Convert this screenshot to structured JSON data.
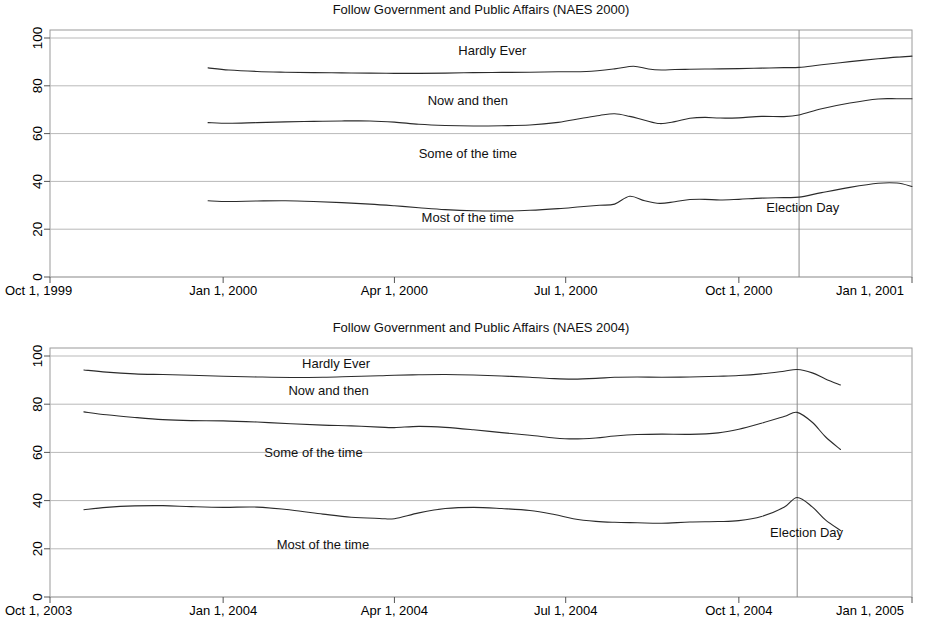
{
  "chart_data": [
    {
      "id": "naes2000",
      "type": "line",
      "title": "Follow Government and Public Affairs (NAES 2000)",
      "xlabel": "",
      "ylabel": "",
      "ylim": [
        0,
        100
      ],
      "yticks": [
        0,
        20,
        40,
        60,
        80,
        100
      ],
      "ytick_labels": [
        "0",
        "20",
        "40",
        "60",
        "80",
        "100"
      ],
      "xtick_labels": [
        "Oct 1, 1999",
        "Jan 1, 2000",
        "Apr 1, 2000",
        "Jul 1, 2000",
        "Oct 1, 2000",
        "Jan 1, 2001"
      ],
      "xlim_days": [
        0,
        458
      ],
      "xticks_days": [
        0,
        92,
        183,
        274,
        366,
        458
      ],
      "grid": true,
      "legend_position": "inline-annotations",
      "annotations": [
        {
          "name": "hardly-ever",
          "text": "Hardly Ever",
          "x_days": 235,
          "y": 93
        },
        {
          "name": "now-and-then",
          "text": "Now and then",
          "x_days": 222,
          "y": 72
        },
        {
          "name": "some-of-the-time",
          "text": "Some of the time",
          "x_days": 222,
          "y": 50
        },
        {
          "name": "most-of-the-time",
          "text": "Most of the time",
          "x_days": 222,
          "y": 23
        },
        {
          "name": "election-day",
          "text": "Election Day",
          "x_days": 400,
          "y": 27
        }
      ],
      "vlines": [
        {
          "name": "election-day-line",
          "x_days": 398,
          "label": "Election Day"
        }
      ],
      "series": [
        {
          "name": "Hardly Ever (cumulative)",
          "x_days": [
            84,
            95,
            110,
            125,
            140,
            155,
            170,
            183,
            196,
            210,
            225,
            240,
            255,
            270,
            285,
            300,
            310,
            318,
            325,
            332,
            340,
            348,
            356,
            366,
            378,
            390,
            398,
            410,
            425,
            440,
            450,
            458
          ],
          "values": [
            87.5,
            86.6,
            86.0,
            85.7,
            85.5,
            85.4,
            85.3,
            85.2,
            85.2,
            85.3,
            85.5,
            85.6,
            85.7,
            85.9,
            86.0,
            87.1,
            88.2,
            87.0,
            86.6,
            86.8,
            86.9,
            87.0,
            87.1,
            87.2,
            87.4,
            87.6,
            87.7,
            88.8,
            90.1,
            91.3,
            92.0,
            92.4
          ]
        },
        {
          "name": "Now and then (cumulative)",
          "x_days": [
            84,
            95,
            110,
            125,
            140,
            155,
            170,
            183,
            196,
            210,
            225,
            240,
            255,
            270,
            282,
            292,
            300,
            308,
            316,
            324,
            332,
            340,
            348,
            356,
            366,
            378,
            390,
            398,
            410,
            425,
            440,
            450,
            458
          ],
          "values": [
            64.6,
            64.3,
            64.6,
            64.9,
            65.1,
            65.3,
            65.3,
            64.8,
            63.9,
            63.4,
            63.2,
            63.3,
            63.6,
            64.7,
            66.3,
            67.6,
            68.3,
            67.2,
            65.6,
            64.2,
            65.0,
            66.4,
            66.8,
            66.5,
            66.6,
            67.2,
            67.1,
            67.8,
            70.4,
            72.8,
            74.5,
            74.6,
            74.6
          ]
        },
        {
          "name": "Most of the time",
          "x_days": [
            84,
            95,
            110,
            125,
            140,
            155,
            170,
            183,
            196,
            210,
            225,
            240,
            255,
            270,
            282,
            292,
            300,
            308,
            316,
            324,
            332,
            340,
            348,
            356,
            366,
            378,
            390,
            398,
            410,
            425,
            440,
            450,
            458
          ],
          "values": [
            31.9,
            31.6,
            31.8,
            31.9,
            31.6,
            31.1,
            30.5,
            29.8,
            29.0,
            28.2,
            27.7,
            27.6,
            27.9,
            28.6,
            29.4,
            30.0,
            30.5,
            33.8,
            31.9,
            30.8,
            31.5,
            32.4,
            32.5,
            32.2,
            32.5,
            33.0,
            33.2,
            33.4,
            35.3,
            37.5,
            39.2,
            39.3,
            37.9
          ]
        }
      ]
    },
    {
      "id": "naes2004",
      "type": "line",
      "title": "Follow Government and Public Affairs (NAES 2004)",
      "xlabel": "",
      "ylabel": "",
      "ylim": [
        0,
        100
      ],
      "yticks": [
        0,
        20,
        40,
        60,
        80,
        100
      ],
      "ytick_labels": [
        "0",
        "20",
        "40",
        "60",
        "80",
        "100"
      ],
      "xtick_labels": [
        "Oct 1, 2003",
        "Jan 1, 2004",
        "Apr 1, 2004",
        "Jul 1, 2004",
        "Oct 1, 2005"
      ],
      "xtick_labels_actual": [
        "Oct 1, 2003",
        "Jan 1, 2004",
        "Apr 1, 2004",
        "Jul 1, 2004",
        "Oct 1, 2004",
        "Jan 1, 2005"
      ],
      "xlim_days": [
        0,
        458
      ],
      "xticks_days": [
        0,
        92,
        183,
        274,
        366,
        458
      ],
      "grid": true,
      "legend_position": "inline-annotations",
      "annotations": [
        {
          "name": "hardly-ever",
          "text": "Hardly Ever",
          "x_days": 152,
          "y": 95
        },
        {
          "name": "now-and-then",
          "text": "Now and then",
          "x_days": 148,
          "y": 84
        },
        {
          "name": "some-of-the-time",
          "text": "Some of the time",
          "x_days": 140,
          "y": 58
        },
        {
          "name": "most-of-the-time",
          "text": "Most of the time",
          "x_days": 145,
          "y": 20
        },
        {
          "name": "election-day",
          "text": "Election Day",
          "x_days": 402,
          "y": 25
        }
      ],
      "vlines": [
        {
          "name": "election-day-line",
          "x_days": 397,
          "label": "Election Day"
        }
      ],
      "series": [
        {
          "name": "Hardly Ever (cumulative)",
          "x_days": [
            18,
            30,
            45,
            60,
            75,
            92,
            110,
            128,
            145,
            160,
            175,
            183,
            196,
            210,
            225,
            240,
            255,
            268,
            278,
            290,
            300,
            312,
            325,
            340,
            355,
            366,
            378,
            390,
            397,
            405,
            412,
            420
          ],
          "values": [
            94.2,
            93.3,
            92.6,
            92.3,
            92.0,
            91.6,
            91.3,
            91.1,
            91.2,
            91.5,
            91.8,
            92.0,
            92.2,
            92.3,
            92.1,
            91.7,
            91.2,
            90.6,
            90.4,
            90.7,
            91.2,
            91.3,
            91.2,
            91.3,
            91.6,
            91.9,
            92.6,
            93.7,
            94.4,
            93.0,
            90.5,
            88.0
          ]
        },
        {
          "name": "Now and then (cumulative)",
          "x_days": [
            18,
            30,
            45,
            60,
            75,
            92,
            110,
            128,
            145,
            160,
            175,
            183,
            196,
            210,
            225,
            240,
            255,
            268,
            278,
            290,
            300,
            312,
            325,
            340,
            355,
            366,
            378,
            390,
            397,
            405,
            412,
            420
          ],
          "values": [
            76.8,
            75.6,
            74.5,
            73.6,
            73.2,
            73.1,
            72.6,
            71.9,
            71.3,
            71.0,
            70.5,
            70.3,
            70.8,
            70.4,
            69.4,
            68.2,
            67.1,
            66.0,
            65.6,
            66.0,
            66.8,
            67.4,
            67.6,
            67.5,
            68.1,
            69.6,
            72.1,
            74.9,
            76.6,
            72.5,
            66.5,
            61.2
          ]
        },
        {
          "name": "Most of the time",
          "x_days": [
            18,
            30,
            45,
            60,
            75,
            92,
            110,
            128,
            145,
            160,
            175,
            183,
            196,
            210,
            225,
            240,
            255,
            268,
            278,
            290,
            300,
            312,
            325,
            340,
            355,
            366,
            378,
            390,
            397,
            405,
            412,
            420
          ],
          "values": [
            36.2,
            37.2,
            37.8,
            37.9,
            37.5,
            37.2,
            37.3,
            36.1,
            34.4,
            33.1,
            32.6,
            32.5,
            34.9,
            36.7,
            37.2,
            36.7,
            35.9,
            34.2,
            32.5,
            31.4,
            31.0,
            30.8,
            30.6,
            31.1,
            31.3,
            31.7,
            33.4,
            37.2,
            41.3,
            37.4,
            32.0,
            27.6
          ]
        }
      ]
    }
  ],
  "style": {
    "line_color": "#2b2b2b",
    "grid_color": "#b9b9b9",
    "frame_color": "#9a9a9a",
    "vline_color": "#8c8c8c",
    "background": "#ffffff"
  }
}
